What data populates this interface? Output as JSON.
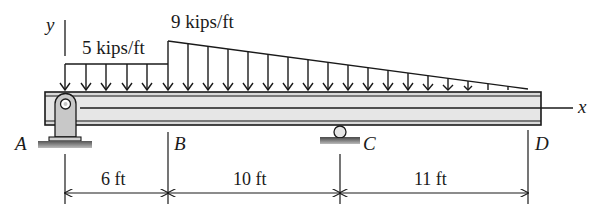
{
  "diagram": {
    "type": "beam-loading",
    "loads": {
      "uniform": {
        "label": "5 kips/ft",
        "value": 5,
        "unit": "kips/ft",
        "from": "A",
        "to": "B"
      },
      "linear": {
        "label": "9 kips/ft",
        "start_value": 9,
        "end_value": 0,
        "unit": "kips/ft",
        "from": "B",
        "to": "D"
      }
    },
    "points": [
      {
        "id": "A",
        "label": "A",
        "support": "pin"
      },
      {
        "id": "B",
        "label": "B",
        "support": "none"
      },
      {
        "id": "C",
        "label": "C",
        "support": "roller"
      },
      {
        "id": "D",
        "label": "D",
        "support": "none"
      }
    ],
    "dimensions": [
      {
        "label": "6 ft",
        "from": "A",
        "to": "B"
      },
      {
        "label": "10 ft",
        "from": "B",
        "to": "C"
      },
      {
        "label": "11 ft",
        "from": "C",
        "to": "D"
      }
    ],
    "axes": {
      "x": "x",
      "y": "y"
    },
    "colors": {
      "ink": "#1a1a1a",
      "beam_fill": "#d9d9d9",
      "support_fill": "#c8c8c8",
      "ground": "#555555"
    }
  }
}
